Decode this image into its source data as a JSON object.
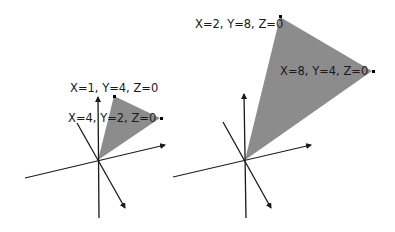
{
  "diagrams": [
    {
      "name": "small-triangle",
      "vertices": [
        {
          "label": "X=1, Y=4, Z=0",
          "x": 1,
          "y": 4,
          "z": 0
        },
        {
          "label": "X=4, Y=2, Z=0",
          "x": 4,
          "y": 2,
          "z": 0
        }
      ]
    },
    {
      "name": "large-triangle",
      "vertices": [
        {
          "label": "X=2, Y=8, Z=0",
          "x": 2,
          "y": 8,
          "z": 0
        },
        {
          "label": "X=8, Y=4, Z=0",
          "x": 8,
          "y": 4,
          "z": 0
        }
      ]
    }
  ],
  "colors": {
    "triangle_fill": "#8c8c8c",
    "axis": "#1a1a1a",
    "background": "#ffffff"
  }
}
